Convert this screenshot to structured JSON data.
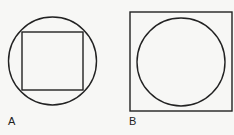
{
  "figures": [
    {
      "label": "A",
      "description": "square inscribed in circle"
    },
    {
      "label": "B",
      "description": "circle inscribed in square"
    }
  ],
  "colors": {
    "stroke": "#222222",
    "background": "#f7f7f5"
  }
}
